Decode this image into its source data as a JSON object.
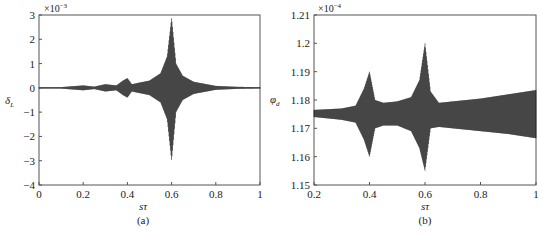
{
  "chart_data": [
    {
      "type": "line",
      "panel": "(a)",
      "title": "",
      "xlabel": "sτ",
      "ylabel": "δ_L",
      "y_scale_label": "×10^-3",
      "xlim": [
        0,
        1
      ],
      "ylim": [
        -4,
        3
      ],
      "xticks": [
        "0",
        "0.2",
        "0.4",
        "0.6",
        "0.8",
        "1"
      ],
      "yticks": [
        "-4",
        "-3",
        "-2",
        "-1",
        "0",
        "1",
        "2",
        "3"
      ],
      "grid": false,
      "description": "Dense oscillation centered at 0 with amplitude envelope; small bursts at sτ≈0.2, 0.3, 0.4 and a large resonance peak at sτ≈0.6",
      "envelope": {
        "x": [
          0.0,
          0.1,
          0.2,
          0.25,
          0.3,
          0.35,
          0.38,
          0.4,
          0.42,
          0.5,
          0.55,
          0.58,
          0.6,
          0.62,
          0.65,
          0.7,
          0.8,
          0.9,
          1.0
        ],
        "upper": [
          0.03,
          0.03,
          0.1,
          0.05,
          0.15,
          0.1,
          0.3,
          0.4,
          0.15,
          0.3,
          0.6,
          1.3,
          2.9,
          1.0,
          0.5,
          0.25,
          0.08,
          0.04,
          0.03
        ],
        "lower": [
          -0.03,
          -0.03,
          -0.1,
          -0.05,
          -0.15,
          -0.1,
          -0.3,
          -0.4,
          -0.15,
          -0.3,
          -0.6,
          -1.3,
          -3.0,
          -1.0,
          -0.5,
          -0.25,
          -0.08,
          -0.04,
          -0.03
        ]
      }
    },
    {
      "type": "line",
      "panel": "(b)",
      "title": "",
      "xlabel": "sτ",
      "ylabel": "φ_d",
      "y_scale_label": "×10^-4",
      "xlim": [
        0.2,
        1
      ],
      "ylim": [
        1.15,
        1.21
      ],
      "xticks": [
        "0.2",
        "0.4",
        "0.6",
        "0.8",
        "1"
      ],
      "yticks": [
        "1.15",
        "1.16",
        "1.17",
        "1.18",
        "1.19",
        "1.2",
        "1.21"
      ],
      "grid": false,
      "description": "Dense oscillation around ~1.175 with resonance peaks at sτ≈0.4 and sτ≈0.6; band widens toward sτ=1",
      "envelope": {
        "x": [
          0.2,
          0.3,
          0.35,
          0.38,
          0.4,
          0.42,
          0.45,
          0.5,
          0.55,
          0.58,
          0.6,
          0.62,
          0.65,
          0.7,
          0.8,
          0.9,
          1.0
        ],
        "upper": [
          1.1765,
          1.177,
          1.178,
          1.184,
          1.19,
          1.18,
          1.179,
          1.1795,
          1.181,
          1.187,
          1.2,
          1.183,
          1.179,
          1.1795,
          1.1805,
          1.182,
          1.1835
        ],
        "lower": [
          1.174,
          1.173,
          1.172,
          1.166,
          1.16,
          1.17,
          1.171,
          1.171,
          1.169,
          1.163,
          1.155,
          1.17,
          1.1705,
          1.17,
          1.169,
          1.168,
          1.1665
        ]
      }
    }
  ],
  "captions": {
    "a": "(a)",
    "b": "(b)"
  },
  "labels": {
    "a": {
      "x": "sτ",
      "y_main": "δ",
      "y_sub": "L",
      "exp_base": "×10",
      "exp_pow": "−3"
    },
    "b": {
      "x": "sτ",
      "y_main": "φ",
      "y_sub": "d",
      "exp_base": "×10",
      "exp_pow": "−4"
    }
  },
  "colors": {
    "trace": "#1a1a1a",
    "axis": "#555555"
  }
}
